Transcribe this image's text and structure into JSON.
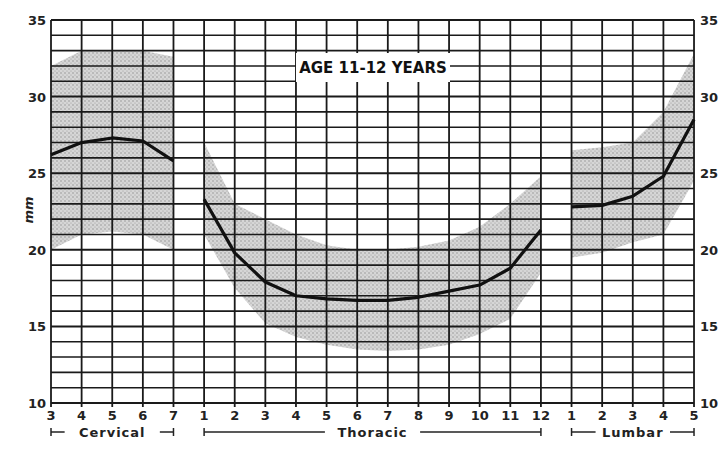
{
  "chart_data": {
    "type": "line",
    "title": "AGE 11-12 YEARS",
    "xlabel": "",
    "ylabel": "mm",
    "ylim": [
      10,
      35
    ],
    "yticks": [
      10,
      15,
      20,
      25,
      30,
      35
    ],
    "grid": true,
    "regions": [
      {
        "name": "Cervical",
        "categories": [
          "3",
          "4",
          "5",
          "6",
          "7"
        ]
      },
      {
        "name": "Thoracic",
        "categories": [
          "1",
          "2",
          "3",
          "4",
          "5",
          "6",
          "7",
          "8",
          "9",
          "10",
          "11",
          "12"
        ]
      },
      {
        "name": "Lumbar",
        "categories": [
          "1",
          "2",
          "3",
          "4",
          "5"
        ]
      }
    ],
    "series": [
      {
        "name": "Cervical mean",
        "x": [
          "C3",
          "C4",
          "C5",
          "C6",
          "C7"
        ],
        "values": [
          26.2,
          27.0,
          27.3,
          27.1,
          25.8
        ]
      },
      {
        "name": "Thoracic mean",
        "x": [
          "T1",
          "T2",
          "T3",
          "T4",
          "T5",
          "T6",
          "T7",
          "T8",
          "T9",
          "T10",
          "T11",
          "T12"
        ],
        "values": [
          23.3,
          19.8,
          17.9,
          17.0,
          16.8,
          16.7,
          16.7,
          16.9,
          17.3,
          17.7,
          18.8,
          21.3
        ]
      },
      {
        "name": "Lumbar mean",
        "x": [
          "L1",
          "L2",
          "L3",
          "L4",
          "L5"
        ],
        "values": [
          22.8,
          22.9,
          23.5,
          24.8,
          28.5
        ]
      }
    ],
    "bands": [
      {
        "region": "Cervical",
        "upper": [
          32.0,
          33.0,
          33.0,
          33.0,
          32.6
        ],
        "lower": [
          20.0,
          21.0,
          21.2,
          21.0,
          20.0
        ]
      },
      {
        "region": "Thoracic",
        "upper": [
          27.0,
          23.0,
          22.0,
          21.0,
          20.3,
          20.0,
          20.0,
          20.2,
          20.6,
          21.5,
          23.0,
          24.8
        ],
        "lower": [
          21.0,
          17.5,
          15.2,
          14.3,
          13.8,
          13.5,
          13.4,
          13.5,
          13.8,
          14.5,
          15.5,
          18.5
        ]
      },
      {
        "region": "Lumbar",
        "upper": [
          26.5,
          26.7,
          27.0,
          29.0,
          32.8
        ],
        "lower": [
          19.5,
          19.8,
          20.5,
          21.0,
          24.5
        ]
      }
    ]
  },
  "labels": {
    "title": "AGE 11-12 YEARS",
    "ylabel": "mm",
    "cervical": "Cervical",
    "thoracic": "Thoracic",
    "lumbar": "Lumbar"
  }
}
